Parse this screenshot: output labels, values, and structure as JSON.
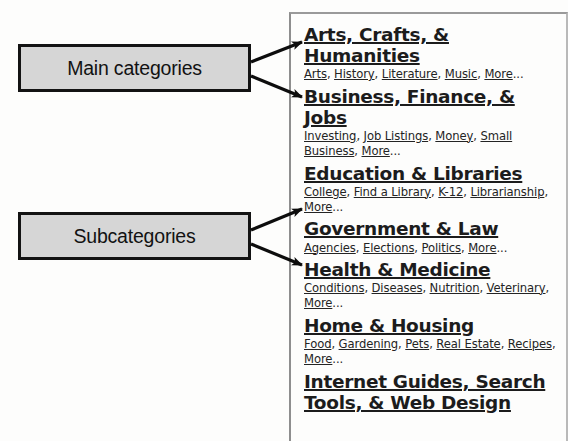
{
  "annotations": {
    "main_categories_label": "Main categories",
    "subcategories_label": "Subcategories"
  },
  "directory": {
    "categories": [
      {
        "heading": "Arts, Crafts, & Humanities",
        "subcategories": [
          "Arts",
          "History",
          "Literature",
          "Music",
          "More"
        ],
        "more_ellipsis": "..."
      },
      {
        "heading": "Business, Finance, & Jobs",
        "subcategories": [
          "Investing",
          "Job Listings",
          "Money",
          "Small Business",
          "More"
        ],
        "more_ellipsis": "..."
      },
      {
        "heading": "Education & Libraries",
        "subcategories": [
          "College",
          "Find a Library",
          "K-12",
          "Librarianship",
          "More"
        ],
        "more_ellipsis": "..."
      },
      {
        "heading": "Government & Law",
        "subcategories": [
          "Agencies",
          "Elections",
          "Politics",
          "More"
        ],
        "more_ellipsis": "..."
      },
      {
        "heading": "Health & Medicine",
        "subcategories": [
          "Conditions",
          "Diseases",
          "Nutrition",
          "Veterinary",
          "More"
        ],
        "more_ellipsis": "..."
      },
      {
        "heading": "Home & Housing",
        "subcategories": [
          "Food",
          "Gardening",
          "Pets",
          "Real Estate",
          "Recipes",
          "More"
        ],
        "more_ellipsis": "..."
      },
      {
        "heading": "Internet Guides, Search Tools, & Web Design",
        "subcategories": [],
        "more_ellipsis": ""
      }
    ],
    "separator": ", "
  },
  "colors": {
    "callout_fill": "#d6d6d6",
    "callout_border": "#131313",
    "arrow": "#0d0d0d",
    "panel_border": "#8e8e8e",
    "heading_text": "#1c1c1c",
    "link_text": "#242424",
    "background": "#fdfdfc"
  }
}
